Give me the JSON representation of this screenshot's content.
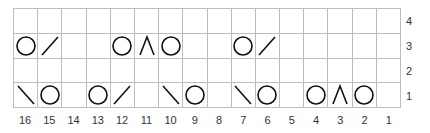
{
  "chart": {
    "columns": [
      "16",
      "15",
      "14",
      "13",
      "12",
      "11",
      "10",
      "9",
      "8",
      "7",
      "6",
      "5",
      "4",
      "3",
      "2",
      "1"
    ],
    "rows_top_to_bottom": [
      "4",
      "3",
      "2",
      "1"
    ],
    "symbol_legend": {
      "O": "yarn-over",
      "/": "k2tog (right-leaning decrease)",
      "\\": "ssk (left-leaning decrease)",
      "^": "centered double decrease",
      "": "knit"
    },
    "grid": [
      [
        "",
        "",
        "",
        "",
        "",
        "",
        "",
        "",
        "",
        "",
        "",
        "",
        "",
        "",
        "",
        ""
      ],
      [
        "O",
        "/",
        "",
        "",
        "O",
        "^",
        "O",
        "",
        "",
        "O",
        "/",
        "",
        "",
        "",
        "",
        ""
      ],
      [
        "",
        "",
        "",
        "",
        "",
        "",
        "",
        "",
        "",
        "",
        "",
        "",
        "",
        "",
        "",
        ""
      ],
      [
        "\\",
        "O",
        "",
        "O",
        "/",
        "",
        "\\",
        "O",
        "",
        "\\",
        "O",
        "",
        "O",
        "^",
        "O",
        ""
      ]
    ],
    "colors": {
      "grid_line": "#bdbdbd",
      "symbol": "#111111",
      "label": "#333333"
    }
  }
}
